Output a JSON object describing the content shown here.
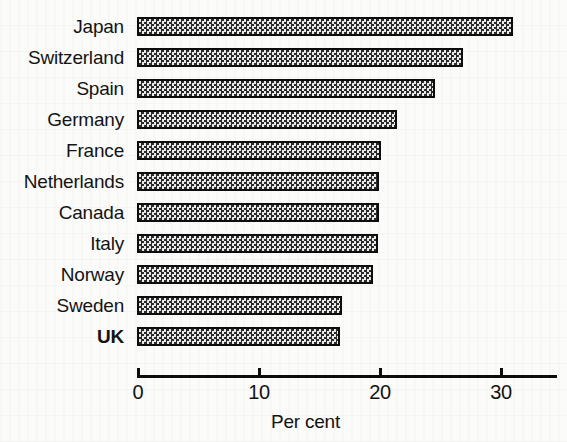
{
  "chart_data": {
    "type": "bar",
    "orientation": "horizontal",
    "title": "",
    "subtitle": "",
    "xlabel": "Per cent",
    "ylabel": "",
    "xlim": [
      0,
      34.7
    ],
    "grid": false,
    "legend": null,
    "axis": {
      "ticks": [
        0,
        10,
        20,
        30
      ],
      "tick_labels": [
        "0",
        "10",
        "20",
        "30"
      ]
    },
    "categories": [
      "Japan",
      "Switzerland",
      "Spain",
      "Germany",
      "France",
      "Netherlands",
      "Canada",
      "Italy",
      "Norway",
      "Sweden",
      "UK"
    ],
    "values": [
      31.1,
      26.9,
      24.6,
      21.5,
      20.2,
      20.0,
      20.0,
      19.9,
      19.5,
      16.9,
      16.8
    ],
    "emphasis_category": "UK",
    "bar_style": {
      "fill": "checkerboard-pattern",
      "fill_color": "#b9b9b9",
      "border_color": "#0c0c0c"
    }
  },
  "page": {
    "background_color": "#fbfbfa",
    "text_color": "#121212"
  }
}
